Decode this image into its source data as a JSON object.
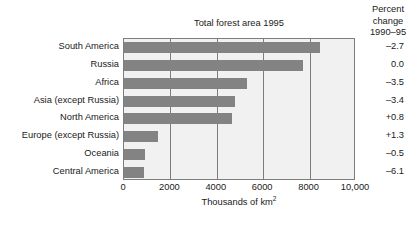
{
  "chart_data": {
    "type": "bar",
    "orientation": "horizontal",
    "title": "Total forest area 1995",
    "xlabel": "Thousands of km",
    "xlabel_superscript": "2",
    "ylabel": "",
    "xlim": [
      0,
      10000
    ],
    "xticks": [
      0,
      2000,
      4000,
      6000,
      8000,
      10000
    ],
    "xtick_labels": [
      "0",
      "2000",
      "4000",
      "6000",
      "8000",
      "10,000"
    ],
    "grid": true,
    "grid_axis": "x",
    "legend": "none",
    "bar_color": "#838383",
    "plot_background": "#f1f1f1",
    "categories": [
      "South America",
      "Russia",
      "Africa",
      "Asia (except Russia)",
      "North America",
      "Europe (except Russia)",
      "Oceania",
      "Central America"
    ],
    "values": [
      8430,
      7700,
      5300,
      4780,
      4650,
      1460,
      900,
      850
    ],
    "annotation_column": {
      "header_lines": [
        "Percent",
        "change",
        "1990–95"
      ],
      "values": [
        "–2.7",
        "0.0",
        "–3.5",
        "–3.4",
        "+0.8",
        "+1.3",
        "–0.5",
        "–6.1"
      ]
    }
  }
}
